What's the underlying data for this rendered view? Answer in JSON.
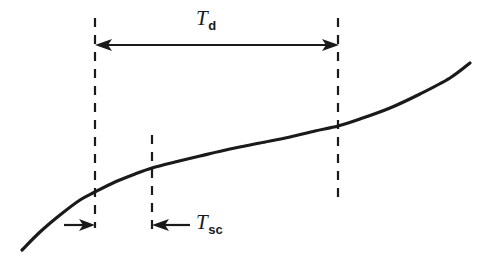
{
  "figure": {
    "background_color": "#ffffff",
    "ink_color": "#1a1a1a",
    "width": 491,
    "height": 258
  },
  "labels": {
    "td": {
      "base": "T",
      "sub": "d",
      "x": 196,
      "y": 8
    },
    "tsc": {
      "base": "T",
      "sub": "sc",
      "x": 196,
      "y": 212
    }
  },
  "chart_data": {
    "type": "line",
    "title": "",
    "xlabel": "",
    "ylabel": "",
    "grid": false,
    "legend": null,
    "xlim": [
      0,
      491
    ],
    "ylim": [
      258,
      0
    ],
    "series": [
      {
        "name": "response-curve",
        "description": "monotonically increasing S-shaped curve",
        "x": [
          22,
          40,
          60,
          80,
          95,
          115,
          135,
          152,
          175,
          200,
          230,
          260,
          290,
          315,
          338,
          360,
          390,
          420,
          450,
          470
        ],
        "y": [
          250,
          232,
          215,
          200,
          192,
          182,
          174,
          168,
          162,
          156,
          149,
          143,
          137,
          131,
          126,
          119,
          108,
          94,
          78,
          63
        ]
      }
    ],
    "annotations": [
      {
        "name": "dashed-line-left",
        "type": "vertical-dashed-line",
        "x": 95,
        "y_start": 18,
        "y_end": 228
      },
      {
        "name": "dashed-line-middle",
        "type": "vertical-dashed-line",
        "x": 152,
        "y_start": 135,
        "y_end": 232
      },
      {
        "name": "dashed-line-right",
        "type": "vertical-dashed-line",
        "x": 338,
        "y_start": 18,
        "y_end": 200
      },
      {
        "name": "td-dimension-arrow",
        "type": "double-headed-arrow",
        "label": "T_d",
        "x_start": 95,
        "x_end": 339,
        "y": 45
      },
      {
        "name": "tsc-left-arrow",
        "type": "single-headed-arrow",
        "direction": "right",
        "x_start": 64,
        "x_end": 95,
        "y": 225
      },
      {
        "name": "tsc-right-arrow",
        "type": "single-headed-arrow",
        "direction": "left",
        "label": "T_sc",
        "x_start": 190,
        "x_end": 152,
        "y": 225
      }
    ]
  }
}
